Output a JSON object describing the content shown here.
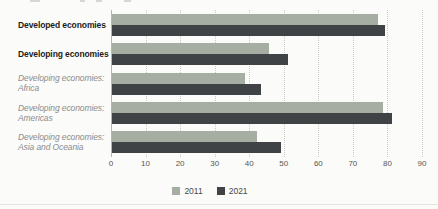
{
  "chart_data": {
    "type": "bar",
    "orientation": "horizontal",
    "title": "",
    "xlabel": "",
    "ylabel": "",
    "xlim": [
      0,
      90
    ],
    "xticks": [
      0,
      10,
      20,
      30,
      40,
      50,
      60,
      70,
      80,
      90
    ],
    "grid": "vertical-dotted",
    "legend_position": "bottom-center",
    "categories": [
      {
        "lines": [
          "Developed economies"
        ],
        "style": "main"
      },
      {
        "lines": [
          "Developing economies"
        ],
        "style": "main"
      },
      {
        "lines": [
          "Developing economies:",
          "Africa"
        ],
        "style": "sub"
      },
      {
        "lines": [
          "Developing economies:",
          "Americas"
        ],
        "style": "sub"
      },
      {
        "lines": [
          "Developing economies:",
          "Asia and Oceania"
        ],
        "style": "sub"
      }
    ],
    "series": [
      {
        "name": "2011",
        "color": "#a6ada3",
        "values": [
          77,
          45.5,
          38.5,
          78.5,
          42
        ]
      },
      {
        "name": "2021",
        "color": "#3f4346",
        "values": [
          79,
          51,
          43,
          81,
          49
        ]
      }
    ]
  },
  "colors": {
    "background": "#fbfbf9",
    "gridline": "#c9c9c6",
    "axis_line": "#b5b5b1",
    "tick_label": "#555550",
    "category_main": "#1c1c1c",
    "category_sub": "#8c8c8c",
    "series_2011": "#a6ada3",
    "series_2021": "#3f4346"
  }
}
